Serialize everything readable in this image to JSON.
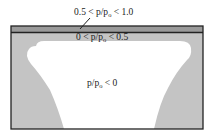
{
  "diagram": {
    "regions": [
      {
        "id": "top-band",
        "label": "0.5 < p/p₀ < 1.0",
        "fill": "#9a9a9a"
      },
      {
        "id": "mid-zone",
        "label": "0 < p/p₀ < 0.5",
        "fill": "#c4c4c4"
      },
      {
        "id": "core",
        "label": "p/p₀ < 0",
        "fill": "#ffffff"
      }
    ],
    "labels": {
      "top": "0.5 < p/p",
      "top_sub": "o",
      "top_end": " < 1.0",
      "mid": "0 < p/p",
      "mid_sub": "o",
      "mid_end": " < 0.5",
      "core": "p/p",
      "core_sub": "o",
      "core_end": " < 0"
    },
    "colors": {
      "frame": "#222222",
      "band": "#9a9a9a",
      "gray": "#c4c4c4",
      "white": "#ffffff"
    }
  }
}
